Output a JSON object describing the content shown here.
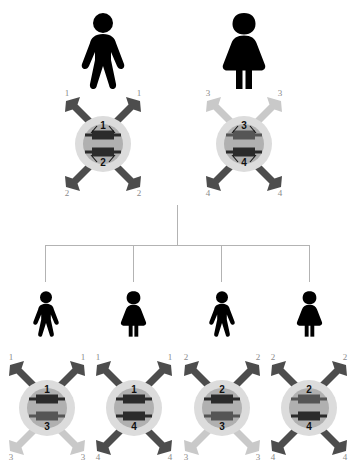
{
  "diagram": {
    "type": "genetic-inheritance-pedigree",
    "background_color": "#ffffff",
    "palette": {
      "arrow_dark": "#4d4d4d",
      "arrow_light": "#c9c9c9",
      "cytoplasm": "#dcdcdc",
      "nucleus": "#b0b0b0",
      "chromosome_dark": "#2b2b2b",
      "chromosome_mid": "#555555",
      "figure": "#000000",
      "pedigree_line": "#b3b3b3",
      "tip_label": "#8a8a8a",
      "nucleus_label": "#111111"
    }
  },
  "parents": [
    {
      "id": "parent-father",
      "sex": "male",
      "figure_icon": "male-figure-icon",
      "cell": {
        "nucleus_top_label": "1",
        "nucleus_bottom_label": "2",
        "tip_labels": {
          "top_left": "1",
          "top_right": "1",
          "bottom_left": "2",
          "bottom_right": "2"
        },
        "arrow_shades": {
          "top_left": "dark",
          "top_right": "dark",
          "bottom_left": "dark",
          "bottom_right": "dark"
        }
      }
    },
    {
      "id": "parent-mother",
      "sex": "female",
      "figure_icon": "female-figure-icon",
      "cell": {
        "nucleus_top_label": "3",
        "nucleus_bottom_label": "4",
        "tip_labels": {
          "top_left": "3",
          "top_right": "3",
          "bottom_left": "4",
          "bottom_right": "4"
        },
        "arrow_shades": {
          "top_left": "light",
          "top_right": "light",
          "bottom_left": "dark",
          "bottom_right": "dark"
        }
      }
    }
  ],
  "children": [
    {
      "id": "child-1",
      "sex": "male",
      "figure_icon": "male-figure-icon",
      "cell": {
        "nucleus_top_label": "1",
        "nucleus_bottom_label": "3",
        "tip_labels": {
          "top_left": "1",
          "top_right": "1",
          "bottom_left": "3",
          "bottom_right": "3"
        },
        "arrow_shades": {
          "top_left": "dark",
          "top_right": "dark",
          "bottom_left": "light",
          "bottom_right": "light"
        }
      }
    },
    {
      "id": "child-2",
      "sex": "female",
      "figure_icon": "female-figure-icon",
      "cell": {
        "nucleus_top_label": "1",
        "nucleus_bottom_label": "4",
        "tip_labels": {
          "top_left": "1",
          "top_right": "1",
          "bottom_left": "4",
          "bottom_right": "4"
        },
        "arrow_shades": {
          "top_left": "dark",
          "top_right": "dark",
          "bottom_left": "dark",
          "bottom_right": "dark"
        }
      }
    },
    {
      "id": "child-3",
      "sex": "male",
      "figure_icon": "male-figure-icon",
      "cell": {
        "nucleus_top_label": "2",
        "nucleus_bottom_label": "3",
        "tip_labels": {
          "top_left": "2",
          "top_right": "2",
          "bottom_left": "3",
          "bottom_right": "3"
        },
        "arrow_shades": {
          "top_left": "dark",
          "top_right": "dark",
          "bottom_left": "light",
          "bottom_right": "light"
        }
      }
    },
    {
      "id": "child-4",
      "sex": "female",
      "figure_icon": "female-figure-icon",
      "cell": {
        "nucleus_top_label": "2",
        "nucleus_bottom_label": "4",
        "tip_labels": {
          "top_left": "2",
          "top_right": "2",
          "bottom_left": "4",
          "bottom_right": "4"
        },
        "arrow_shades": {
          "top_left": "dark",
          "top_right": "dark",
          "bottom_left": "dark",
          "bottom_right": "dark"
        }
      }
    }
  ]
}
